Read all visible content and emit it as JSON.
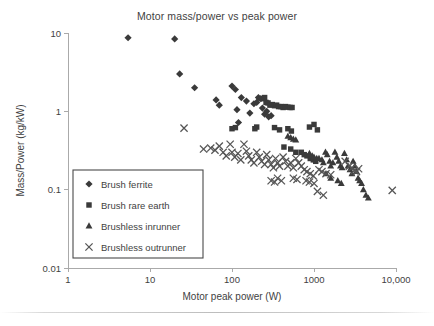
{
  "chart_data": {
    "type": "scatter",
    "title": "Motor mass/power vs peak power",
    "xlabel": "Motor peak power (W)",
    "ylabel": "Mass/Power (kg/kW)",
    "xscale": "log",
    "yscale": "log",
    "xlim": [
      1,
      10000
    ],
    "ylim": [
      0.01,
      10
    ],
    "grid": false,
    "legend_position": "lower-left-inside",
    "xticks": [
      1,
      10,
      100,
      1000,
      10000
    ],
    "xtick_labels": [
      "1",
      "10",
      "100",
      "1000",
      "10,000"
    ],
    "yticks": [
      0.01,
      0.1,
      1,
      10
    ],
    "ytick_labels": [
      "0.01",
      "0.1",
      "1",
      "10"
    ],
    "marker_color": "#3a3a3a",
    "x_marker_color": "#555555",
    "series": [
      {
        "name": "Brush ferrite",
        "marker": "diamond",
        "color": "#3a3a3a",
        "points": [
          [
            5.4,
            8.7
          ],
          [
            20.0,
            8.4
          ],
          [
            23.0,
            3.0
          ],
          [
            35.0,
            2.0
          ],
          [
            64.0,
            1.4
          ],
          [
            70.0,
            1.2
          ],
          [
            100.0,
            2.1
          ],
          [
            110.0,
            1.9
          ],
          [
            115.0,
            1.05
          ],
          [
            120.0,
            0.72
          ],
          [
            130.0,
            1.5
          ],
          [
            150.0,
            1.35
          ],
          [
            165.0,
            0.95
          ],
          [
            185.0,
            1.25
          ],
          [
            200.0,
            1.3
          ],
          [
            210.0,
            1.5
          ],
          [
            225.0,
            1.45
          ],
          [
            235.0,
            1.1
          ],
          [
            250.0,
            0.92
          ],
          [
            265.0,
            1.0
          ],
          [
            280.0,
            0.85
          ],
          [
            300.0,
            0.88
          ]
        ]
      },
      {
        "name": "Brush rare earth",
        "marker": "square",
        "color": "#3a3a3a",
        "points": [
          [
            100.0,
            0.6
          ],
          [
            110.0,
            0.62
          ],
          [
            190.0,
            0.6
          ],
          [
            200.0,
            0.63
          ],
          [
            230.0,
            1.45
          ],
          [
            250.0,
            1.5
          ],
          [
            260.0,
            1.3
          ],
          [
            275.0,
            1.28
          ],
          [
            290.0,
            1.2
          ],
          [
            310.0,
            1.22
          ],
          [
            330.0,
            1.18
          ],
          [
            350.0,
            1.2
          ],
          [
            370.0,
            1.15
          ],
          [
            395.0,
            1.15
          ],
          [
            420.0,
            1.12
          ],
          [
            450.0,
            1.15
          ],
          [
            480.0,
            1.13
          ],
          [
            510.0,
            1.12
          ],
          [
            540.0,
            1.12
          ],
          [
            330.0,
            0.62
          ],
          [
            380.0,
            0.58
          ],
          [
            480.0,
            0.6
          ],
          [
            530.0,
            0.56
          ],
          [
            880.0,
            0.63
          ],
          [
            1000.0,
            0.68
          ],
          [
            1100.0,
            0.58
          ],
          [
            430.0,
            0.35
          ],
          [
            520.0,
            0.33
          ],
          [
            600.0,
            0.3
          ],
          [
            700.0,
            0.3
          ],
          [
            760.0,
            0.28
          ],
          [
            820.0,
            0.27
          ],
          [
            900.0,
            0.25
          ],
          [
            980.0,
            0.24
          ],
          [
            1050.0,
            0.23
          ]
        ]
      },
      {
        "name": "Brushless inrunner",
        "marker": "triangle",
        "color": "#3a3a3a",
        "points": [
          [
            480.0,
            0.48
          ],
          [
            520.0,
            0.46
          ],
          [
            560.0,
            0.44
          ],
          [
            600.0,
            0.43
          ],
          [
            880.0,
            0.29
          ],
          [
            950.0,
            0.27
          ],
          [
            1000.0,
            0.26
          ],
          [
            1080.0,
            0.25
          ],
          [
            1150.0,
            0.25
          ],
          [
            1250.0,
            0.24
          ],
          [
            1300.0,
            0.22
          ],
          [
            1380.0,
            0.3
          ],
          [
            1450.0,
            0.28
          ],
          [
            1550.0,
            0.23
          ],
          [
            1600.0,
            0.2
          ],
          [
            1700.0,
            0.22
          ],
          [
            1800.0,
            0.3
          ],
          [
            1900.0,
            0.26
          ],
          [
            2000.0,
            0.23
          ],
          [
            2100.0,
            0.2
          ],
          [
            2200.0,
            0.19
          ],
          [
            2350.0,
            0.29
          ],
          [
            2500.0,
            0.24
          ],
          [
            2600.0,
            0.2
          ],
          [
            2750.0,
            0.18
          ],
          [
            2900.0,
            0.16
          ],
          [
            3000.0,
            0.23
          ],
          [
            3150.0,
            0.2
          ],
          [
            3300.0,
            0.17
          ],
          [
            3450.0,
            0.14
          ],
          [
            3600.0,
            0.13
          ],
          [
            3800.0,
            0.12
          ],
          [
            4000.0,
            0.1
          ],
          [
            4300.0,
            0.085
          ],
          [
            4600.0,
            0.078
          ],
          [
            1950.0,
            0.13
          ],
          [
            2150.0,
            0.12
          ],
          [
            1600.0,
            0.14
          ],
          [
            1400.0,
            0.16
          ]
        ]
      },
      {
        "name": "Brushless outrunner",
        "marker": "x",
        "color": "#555555",
        "points": [
          [
            26.0,
            0.61
          ],
          [
            45.0,
            0.33
          ],
          [
            55.0,
            0.34
          ],
          [
            62.0,
            0.32
          ],
          [
            70.0,
            0.36
          ],
          [
            78.0,
            0.3
          ],
          [
            85.0,
            0.27
          ],
          [
            95.0,
            0.38
          ],
          [
            100.0,
            0.3
          ],
          [
            108.0,
            0.26
          ],
          [
            118.0,
            0.29
          ],
          [
            128.0,
            0.24
          ],
          [
            140.0,
            0.38
          ],
          [
            150.0,
            0.31
          ],
          [
            160.0,
            0.27
          ],
          [
            172.0,
            0.24
          ],
          [
            185.0,
            0.22
          ],
          [
            200.0,
            0.3
          ],
          [
            215.0,
            0.26
          ],
          [
            230.0,
            0.23
          ],
          [
            250.0,
            0.21
          ],
          [
            265.0,
            0.28
          ],
          [
            280.0,
            0.24
          ],
          [
            300.0,
            0.21
          ],
          [
            320.0,
            0.19
          ],
          [
            340.0,
            0.25
          ],
          [
            360.0,
            0.22
          ],
          [
            380.0,
            0.2
          ],
          [
            300.0,
            0.13
          ],
          [
            330.0,
            0.125
          ],
          [
            360.0,
            0.14
          ],
          [
            400.0,
            0.13
          ],
          [
            420.0,
            0.26
          ],
          [
            450.0,
            0.23
          ],
          [
            480.0,
            0.2
          ],
          [
            520.0,
            0.22
          ],
          [
            560.0,
            0.19
          ],
          [
            600.0,
            0.25
          ],
          [
            650.0,
            0.22
          ],
          [
            700.0,
            0.2
          ],
          [
            560.0,
            0.14
          ],
          [
            620.0,
            0.135
          ],
          [
            760.0,
            0.18
          ],
          [
            820.0,
            0.17
          ],
          [
            900.0,
            0.16
          ],
          [
            980.0,
            0.15
          ],
          [
            800.0,
            0.13
          ],
          [
            880.0,
            0.125
          ],
          [
            1000.0,
            0.12
          ],
          [
            1100.0,
            0.095
          ],
          [
            1300.0,
            0.085
          ],
          [
            1150.0,
            0.18
          ],
          [
            1250.0,
            0.17
          ],
          [
            1400.0,
            0.16
          ],
          [
            1600.0,
            0.155
          ],
          [
            2400.0,
            0.23
          ],
          [
            2700.0,
            0.2
          ],
          [
            2900.0,
            0.19
          ],
          [
            3100.0,
            0.175
          ],
          [
            3300.0,
            0.17
          ],
          [
            3500.0,
            0.185
          ],
          [
            9000.0,
            0.098
          ]
        ]
      }
    ]
  },
  "legend": {
    "items": [
      {
        "label": "Brush ferrite",
        "marker": "diamond"
      },
      {
        "label": "Brush rare earth",
        "marker": "square"
      },
      {
        "label": "Brushless inrunner",
        "marker": "triangle"
      },
      {
        "label": "Brushless outrunner",
        "marker": "x"
      }
    ]
  }
}
